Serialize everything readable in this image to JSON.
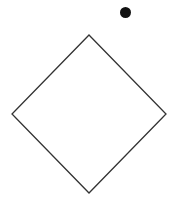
{
  "canvas": {
    "width": 185,
    "height": 203,
    "background": "#ffffff"
  },
  "shapes": {
    "diamond": {
      "points": "89,35 166,114 89,193 12,114",
      "stroke": "#333333",
      "stroke_width": 1.3,
      "fill": "none"
    },
    "dot": {
      "cx": 125.5,
      "cy": 12.5,
      "r": 5.5,
      "fill": "#111111"
    }
  }
}
